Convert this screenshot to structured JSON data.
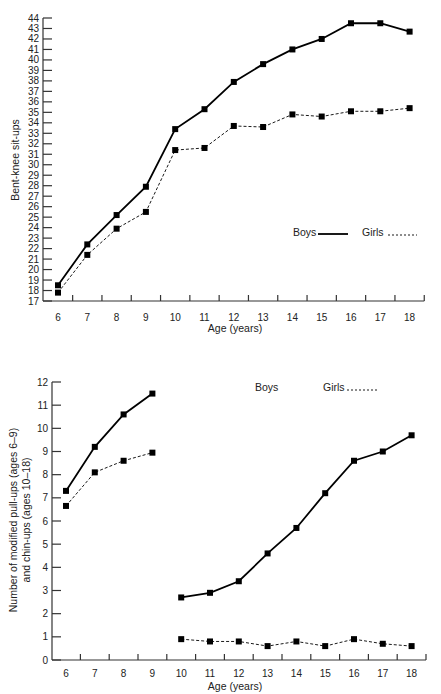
{
  "chart_data": [
    {
      "type": "line",
      "title": "",
      "xlabel": "Age (years)",
      "ylabel": "Bent-knee sit-ups",
      "x": [
        6,
        7,
        8,
        9,
        10,
        11,
        12,
        13,
        14,
        15,
        16,
        17,
        18
      ],
      "ylim": [
        17,
        44
      ],
      "yticks": [
        17,
        18,
        19,
        20,
        21,
        22,
        23,
        24,
        25,
        26,
        27,
        28,
        29,
        30,
        31,
        32,
        33,
        34,
        35,
        36,
        37,
        38,
        39,
        40,
        41,
        42,
        43,
        44
      ],
      "grid": false,
      "legend_position": "right-middle",
      "series": [
        {
          "name": "Boys",
          "style": "solid",
          "values": [
            18.5,
            22.4,
            25.2,
            27.9,
            33.4,
            35.3,
            37.9,
            39.6,
            41.0,
            42.0,
            43.5,
            43.5,
            42.7
          ]
        },
        {
          "name": "Girls",
          "style": "dashed",
          "values": [
            17.8,
            21.4,
            23.9,
            25.5,
            31.4,
            31.6,
            33.7,
            33.6,
            34.8,
            34.6,
            35.1,
            35.1,
            35.4
          ]
        }
      ]
    },
    {
      "type": "line",
      "title": "",
      "xlabel": "Age (years)",
      "ylabel": "Number of modified pull-ups (ages 6–9) and chin-ups (ages 10–18)",
      "ylabel_lines": [
        "Number of modified pull-ups (ages 6–9)",
        "and chin-ups (ages 10–18)"
      ],
      "x": [
        6,
        7,
        8,
        9,
        10,
        11,
        12,
        13,
        14,
        15,
        16,
        17,
        18
      ],
      "ylim": [
        0,
        12
      ],
      "yticks": [
        0,
        1,
        2,
        3,
        4,
        5,
        6,
        7,
        8,
        9,
        10,
        11,
        12
      ],
      "grid": false,
      "legend_position": "top-right",
      "series": [
        {
          "name": "Boys",
          "style": "solid",
          "segments": [
            {
              "x": [
                6,
                7,
                8,
                9
              ],
              "values": [
                7.3,
                9.2,
                10.6,
                11.5
              ]
            },
            {
              "x": [
                10,
                11,
                12,
                13,
                14,
                15,
                16,
                17,
                18
              ],
              "values": [
                2.7,
                2.9,
                3.4,
                4.6,
                5.7,
                7.2,
                8.6,
                9.0,
                9.7
              ]
            }
          ]
        },
        {
          "name": "Girls",
          "style": "dashed",
          "segments": [
            {
              "x": [
                6,
                7,
                8,
                9
              ],
              "values": [
                6.65,
                8.1,
                8.6,
                8.95
              ]
            },
            {
              "x": [
                10,
                11,
                12,
                13,
                14,
                15,
                16,
                17,
                18
              ],
              "values": [
                0.9,
                0.8,
                0.8,
                0.6,
                0.8,
                0.6,
                0.9,
                0.7,
                0.6
              ]
            }
          ]
        }
      ]
    }
  ],
  "top_chart": {
    "ylabel": "Bent-knee sit-ups",
    "xlabel": "Age (years)",
    "legend": {
      "boys": "Boys",
      "girls": "Girls"
    }
  },
  "bottom_chart": {
    "ylabel_line1": "Number of modified pull-ups (ages 6–9)",
    "ylabel_line2": "and chin-ups (ages 10–18)",
    "xlabel": "Age (years)",
    "legend": {
      "boys": "Boys",
      "girls": "Girls"
    }
  }
}
